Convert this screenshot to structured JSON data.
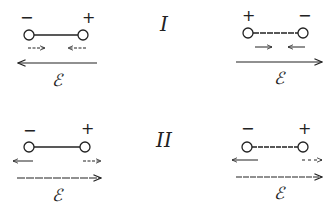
{
  "diagram": {
    "rows": [
      {
        "label": "I",
        "panels": [
          {
            "side": "left",
            "left_charge": "−",
            "right_charge": "+",
            "small_arrows": [
              "right",
              "left"
            ],
            "field_direction": "left",
            "field_label": "ℰ"
          },
          {
            "side": "right",
            "left_charge": "+",
            "right_charge": "−",
            "small_arrows": [
              "right",
              "left"
            ],
            "field_direction": "right",
            "field_label": "ℰ"
          }
        ]
      },
      {
        "label": "II",
        "panels": [
          {
            "side": "left",
            "left_charge": "−",
            "right_charge": "+",
            "small_arrows": [
              "left",
              "right"
            ],
            "field_direction": "right",
            "field_label": "ℰ"
          },
          {
            "side": "right",
            "left_charge": "−",
            "right_charge": "+",
            "small_arrows": [
              "left",
              "right"
            ],
            "field_direction": "right",
            "field_label": "ℰ"
          }
        ]
      }
    ],
    "colors": {
      "ink": "#222222",
      "background": "#ffffff"
    }
  }
}
